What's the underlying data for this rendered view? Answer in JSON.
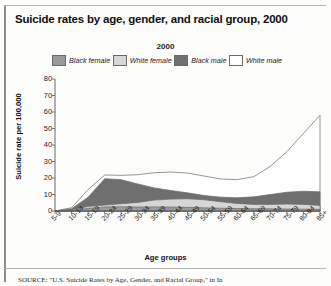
{
  "figure": {
    "title": "Suicide rates by age, gender, and racial group, 2000",
    "source": "SOURCE: \"U.S. Suicide Rates by Age, Gender, and Racial Group,\" in In"
  },
  "colors": {
    "black_female": "#9a9a9a",
    "white_female": "#d6d6d6",
    "black_male": "#6f6f6f",
    "white_male": "#ffffff",
    "outline": "#6b6b6b",
    "axis": "#555555"
  },
  "chart_data": {
    "type": "area",
    "title": "2000",
    "xlabel": "Age groups",
    "ylabel": "Suicide rate per 100,000",
    "ylim": [
      0,
      80
    ],
    "yticks": [
      0,
      10,
      20,
      30,
      40,
      50,
      60,
      70,
      80
    ],
    "grid": false,
    "legend_position": "top",
    "overlap": "overlapping",
    "categories": [
      "5-9",
      "10-14",
      "15-19",
      "20-24",
      "25-29",
      "30-34",
      "35-39",
      "40-44",
      "45-49",
      "50-54",
      "55-59",
      "60-64",
      "65-69",
      "70-74",
      "75-79",
      "80-84",
      "85+"
    ],
    "series": [
      {
        "name": "Black female",
        "color": "#9a9a9a",
        "values": [
          0,
          0.3,
          1.6,
          2.5,
          2.6,
          2.4,
          2.5,
          2.4,
          2.2,
          1.9,
          1.7,
          1.5,
          1.4,
          1.3,
          1.2,
          1.1,
          1.0
        ]
      },
      {
        "name": "White female",
        "color": "#d6d6d6",
        "values": [
          0,
          0.6,
          2.8,
          3.6,
          4.4,
          5.2,
          6.6,
          7.2,
          7.4,
          6.8,
          5.6,
          4.6,
          4.0,
          4.0,
          4.2,
          4.0,
          3.4
        ]
      },
      {
        "name": "Black male",
        "color": "#6f6f6f",
        "values": [
          0,
          1.4,
          8.4,
          19.6,
          19.0,
          16.4,
          14.0,
          12.4,
          11.0,
          9.4,
          8.4,
          8.0,
          8.6,
          10.0,
          11.4,
          12.0,
          11.6
        ]
      },
      {
        "name": "White male",
        "color": "#ffffff",
        "values": [
          0,
          2.0,
          13.0,
          21.8,
          21.6,
          22.0,
          23.2,
          23.6,
          23.0,
          21.2,
          19.4,
          19.0,
          20.8,
          27.0,
          36.0,
          47.0,
          58.0
        ]
      }
    ]
  }
}
